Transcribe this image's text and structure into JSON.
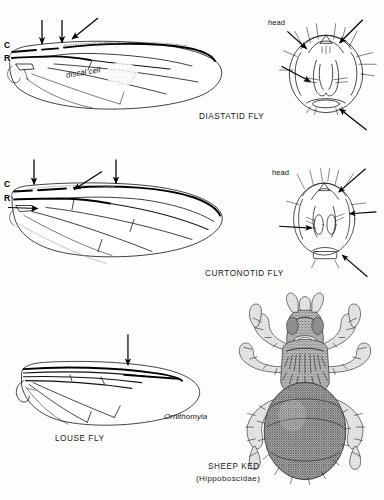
{
  "plate": {
    "title_row_ghost": "· · · · · · · · · ·",
    "background_color": "#fdfdfc",
    "ink_color": "#111111"
  },
  "figures": [
    {
      "id": "diastatid",
      "caption": "DIASTATID FLY",
      "wing": {
        "vein_labels": [
          "C",
          "R"
        ],
        "cell_label": "discal cell",
        "arrow_count": 3,
        "feature": "costal breaks"
      },
      "head": {
        "label": "head",
        "arrow_count": 3
      }
    },
    {
      "id": "curtonotid",
      "caption": "CURTONOTID FLY",
      "wing": {
        "vein_labels": [
          "C",
          "R"
        ],
        "cell_label": "",
        "arrow_count": 4,
        "feature": "costal breaks"
      },
      "head": {
        "label": "head",
        "arrow_count": 3
      }
    },
    {
      "id": "louse-fly",
      "caption": "LOUSE FLY",
      "wing": {
        "vein_labels": [],
        "genus_label": "Ornithomyia",
        "arrow_count": 1,
        "feature": "crowded anterior veins"
      }
    },
    {
      "id": "sheep-ked",
      "caption": "SHEEP KED",
      "subcaption": "(Hippoboscidae)",
      "legs": 6,
      "rendering": "stipple engraving"
    }
  ],
  "labels": {
    "costa": "C",
    "radius": "R",
    "discal_cell": "discal cell",
    "head": "head",
    "ornithomyia": "Ornithomyia",
    "diastatid_fly": "DIASTATID FLY",
    "curtonotid_fly": "CURTONOTID FLY",
    "louse_fly": "LOUSE FLY",
    "sheep_ked": "SHEEP KED",
    "hippoboscidae": "(Hippoboscidae)"
  }
}
